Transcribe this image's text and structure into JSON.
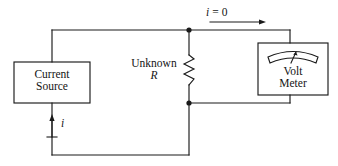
{
  "figure": {
    "width": 338,
    "height": 166,
    "line_color": "#1a1a1a",
    "background_color": "#ffffff"
  },
  "blocks": {
    "current_source": {
      "line1": "Current",
      "line2": "Source",
      "x": 14,
      "y": 62,
      "w": 76,
      "h": 41
    },
    "volt_meter": {
      "line1": "Volt",
      "line2": "Meter",
      "x": 258,
      "y": 43,
      "w": 70,
      "h": 52
    }
  },
  "components": {
    "resistor": {
      "label_line1": "Unknown",
      "label_line2": "R",
      "x": 189,
      "y_top": 55,
      "y_bottom": 85,
      "peaks": 6
    }
  },
  "annotations": {
    "top_current": {
      "text": "i = 0",
      "symbol": "i",
      "relation": "=",
      "value": "0",
      "arrow_direction": "right"
    },
    "source_current": {
      "text": "i",
      "polarity": "+",
      "arrow_direction": "up"
    }
  },
  "nodes": {
    "top_node": {
      "x": 189,
      "y": 30
    },
    "bottom_node": {
      "x": 189,
      "y": 103
    }
  }
}
